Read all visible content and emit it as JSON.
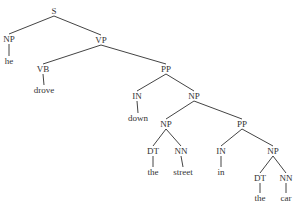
{
  "diagram": {
    "type": "constituency-parse-tree",
    "sentence": "he drove down the street in the car",
    "nodes": [
      {
        "id": "S",
        "label": "S",
        "x": 54,
        "y": 11
      },
      {
        "id": "NP1",
        "label": "NP",
        "x": 9,
        "y": 39
      },
      {
        "id": "he",
        "label": "he",
        "x": 9,
        "y": 61
      },
      {
        "id": "VP",
        "label": "VP",
        "x": 101,
        "y": 40
      },
      {
        "id": "VB",
        "label": "VB",
        "x": 43,
        "y": 69
      },
      {
        "id": "drove",
        "label": "drove",
        "x": 44,
        "y": 90
      },
      {
        "id": "PP1",
        "label": "PP",
        "x": 166,
        "y": 69
      },
      {
        "id": "IN1",
        "label": "IN",
        "x": 137,
        "y": 96
      },
      {
        "id": "down",
        "label": "down",
        "x": 138,
        "y": 118
      },
      {
        "id": "NP2",
        "label": "NP",
        "x": 194,
        "y": 96
      },
      {
        "id": "NP3",
        "label": "NP",
        "x": 166,
        "y": 124
      },
      {
        "id": "DT1",
        "label": "DT",
        "x": 153,
        "y": 151
      },
      {
        "id": "the1",
        "label": "the",
        "x": 153,
        "y": 172
      },
      {
        "id": "NN1",
        "label": "NN",
        "x": 181,
        "y": 151
      },
      {
        "id": "street",
        "label": "street",
        "x": 183,
        "y": 172
      },
      {
        "id": "PP2",
        "label": "PP",
        "x": 242,
        "y": 124
      },
      {
        "id": "IN2",
        "label": "IN",
        "x": 221,
        "y": 151
      },
      {
        "id": "in",
        "label": "in",
        "x": 221,
        "y": 172
      },
      {
        "id": "NP4",
        "label": "NP",
        "x": 273,
        "y": 151
      },
      {
        "id": "DT2",
        "label": "DT",
        "x": 260,
        "y": 178
      },
      {
        "id": "the2",
        "label": "the",
        "x": 260,
        "y": 198
      },
      {
        "id": "NN2",
        "label": "NN",
        "x": 286,
        "y": 178
      },
      {
        "id": "car",
        "label": "car",
        "x": 286,
        "y": 198
      }
    ],
    "edges": [
      [
        "S",
        "NP1"
      ],
      [
        "S",
        "VP"
      ],
      [
        "NP1",
        "he"
      ],
      [
        "VP",
        "VB"
      ],
      [
        "VP",
        "PP1"
      ],
      [
        "VB",
        "drove"
      ],
      [
        "PP1",
        "IN1"
      ],
      [
        "PP1",
        "NP2"
      ],
      [
        "IN1",
        "down"
      ],
      [
        "NP2",
        "NP3"
      ],
      [
        "NP2",
        "PP2"
      ],
      [
        "NP3",
        "DT1"
      ],
      [
        "NP3",
        "NN1"
      ],
      [
        "DT1",
        "the1"
      ],
      [
        "NN1",
        "street"
      ],
      [
        "PP2",
        "IN2"
      ],
      [
        "PP2",
        "NP4"
      ],
      [
        "IN2",
        "in"
      ],
      [
        "NP4",
        "DT2"
      ],
      [
        "NP4",
        "NN2"
      ],
      [
        "DT2",
        "the2"
      ],
      [
        "NN2",
        "car"
      ]
    ]
  }
}
